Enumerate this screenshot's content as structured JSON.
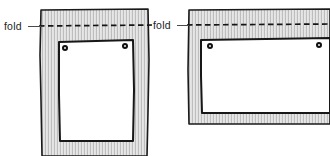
{
  "figure": {
    "background_color": "#ffffff",
    "width": 330,
    "height": 156,
    "ink_color": "#171717",
    "fabric_color": "#dcdcdc",
    "card_color": "#ffffff",
    "fold_line_style": "dashed"
  },
  "panels": [
    {
      "id": "left-panel",
      "orientation": "portrait",
      "fold_label": "fold",
      "fold_line_y": 26,
      "fabric": {
        "x": 40,
        "y": 9,
        "width": 110,
        "height": 147
      },
      "card": {
        "x": 58,
        "y": 41,
        "width": 75,
        "height": 100
      },
      "rivets": [
        {
          "name": "rivet-top-left",
          "x": 63,
          "y": 46
        },
        {
          "name": "rivet-top-right",
          "x": 122,
          "y": 44
        }
      ]
    },
    {
      "id": "right-panel",
      "orientation": "landscape",
      "fold_label": "fold",
      "fold_line_y": 24,
      "fabric": {
        "x": 188,
        "y": 9,
        "width": 142,
        "height": 115
      },
      "card": {
        "x": 200,
        "y": 39,
        "width": 130,
        "height": 74
      },
      "rivets": [
        {
          "name": "rivet-top-left",
          "x": 208,
          "y": 44
        },
        {
          "name": "rivet-top-right",
          "x": 316,
          "y": 43
        }
      ]
    }
  ],
  "labels": {
    "left_fold": "fold",
    "right_fold": "fold"
  }
}
